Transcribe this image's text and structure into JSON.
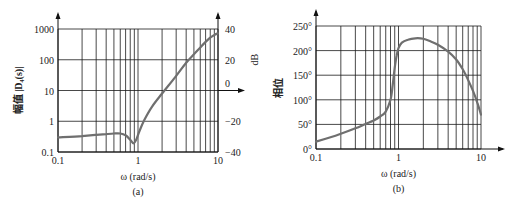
{
  "chart_data": [
    {
      "id": "a",
      "type": "line",
      "caption": "(a)",
      "title": "",
      "xlabel": "ω (rad/s)",
      "ylabel": "幅值 |D₄(s)|",
      "ylabel_right": "dB",
      "xscale": "log",
      "yscale": "log",
      "xlim": [
        0.1,
        10
      ],
      "ylim": [
        0.1,
        1000
      ],
      "x_ticks": [
        {
          "v": 0.1,
          "label": "0.1"
        },
        {
          "v": 1,
          "label": "1"
        },
        {
          "v": 10,
          "label": "10"
        }
      ],
      "y_ticks": [
        {
          "v": 0.1,
          "label": "0.1"
        },
        {
          "v": 1,
          "label": "1"
        },
        {
          "v": 10,
          "label": "10"
        },
        {
          "v": 100,
          "label": "100"
        },
        {
          "v": 1000,
          "label": "1000"
        }
      ],
      "y_ticks_right": [
        {
          "v": 1000,
          "label": "40"
        },
        {
          "v": 100,
          "label": "20"
        },
        {
          "v": 10,
          "label": "0"
        },
        {
          "v": 1,
          "label": "−20"
        },
        {
          "v": 0.1,
          "label": "−40"
        }
      ],
      "grid": true,
      "series": [
        {
          "name": "magnitude",
          "x": [
            0.1,
            0.2,
            0.3,
            0.4,
            0.5,
            0.6,
            0.7,
            0.8,
            0.88,
            0.95,
            1.05,
            1.2,
            1.5,
            2,
            3,
            4,
            5,
            6,
            7,
            8,
            9,
            10
          ],
          "y": [
            0.3,
            0.33,
            0.36,
            0.38,
            0.4,
            0.4,
            0.35,
            0.25,
            0.19,
            0.25,
            0.5,
            1.1,
            3,
            8,
            30,
            80,
            150,
            250,
            380,
            520,
            640,
            720
          ]
        }
      ]
    },
    {
      "id": "b",
      "type": "line",
      "caption": "(b)",
      "title": "",
      "xlabel": "ω (rad/s)",
      "ylabel": "相位",
      "xscale": "log",
      "yscale": "linear",
      "xlim": [
        0.1,
        10
      ],
      "ylim": [
        0,
        250
      ],
      "x_ticks": [
        {
          "v": 0.1,
          "label": "0.1"
        },
        {
          "v": 1,
          "label": "1"
        },
        {
          "v": 10,
          "label": "10"
        }
      ],
      "y_ticks": [
        {
          "v": 0,
          "label": "0°"
        },
        {
          "v": 50,
          "label": "50°"
        },
        {
          "v": 100,
          "label": "100°"
        },
        {
          "v": 150,
          "label": "150°"
        },
        {
          "v": 200,
          "label": "200°"
        },
        {
          "v": 250,
          "label": "250°"
        }
      ],
      "grid": true,
      "series": [
        {
          "name": "phase",
          "x": [
            0.1,
            0.15,
            0.2,
            0.3,
            0.4,
            0.5,
            0.6,
            0.7,
            0.8,
            0.85,
            0.9,
            0.95,
            1.0,
            1.1,
            1.3,
            1.6,
            2,
            2.5,
            3,
            4,
            5,
            6,
            7,
            8,
            9,
            10
          ],
          "y": [
            15,
            24,
            31,
            42,
            51,
            58,
            66,
            76,
            100,
            130,
            165,
            190,
            205,
            216,
            222,
            225,
            224,
            218,
            212,
            198,
            182,
            162,
            140,
            118,
            95,
            70
          ]
        }
      ]
    }
  ]
}
